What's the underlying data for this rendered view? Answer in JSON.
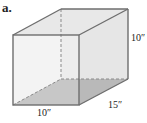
{
  "figure": {
    "part_label": "a.",
    "shape": "rectangular-prism",
    "dimensions": {
      "height": "10″",
      "depth": "15″",
      "width": "10″"
    },
    "colors": {
      "edge": "#6e6e6e",
      "face": "#ececec",
      "base": "#b9b9b9",
      "hidden_edge": "#8a8a8a"
    }
  }
}
